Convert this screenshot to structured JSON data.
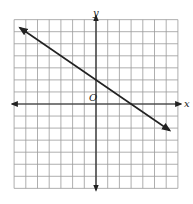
{
  "chart_data": {
    "type": "line",
    "title": "",
    "xlabel": "x",
    "ylabel": "y",
    "origin_label": "O",
    "xlim": [
      -7,
      7
    ],
    "ylim": [
      -7,
      7
    ],
    "grid": true,
    "grid_step": 1,
    "axes_arrows": true,
    "tick_labels": false,
    "series": [
      {
        "name": "line",
        "equation": "y = -2/3 x + 2",
        "slope": -0.6667,
        "y_intercept": 2,
        "x_intercept": 3,
        "x": [
          -6.5,
          6.3
        ],
        "y": [
          6.33,
          -2.2
        ],
        "arrows_both_ends": true,
        "color": "#222222"
      }
    ]
  },
  "labels": {
    "x_axis": "x",
    "y_axis": "y",
    "origin": "O"
  },
  "colors": {
    "grid": "#9a9a9a",
    "axis": "#222222",
    "line": "#222222",
    "background": "#ffffff"
  }
}
